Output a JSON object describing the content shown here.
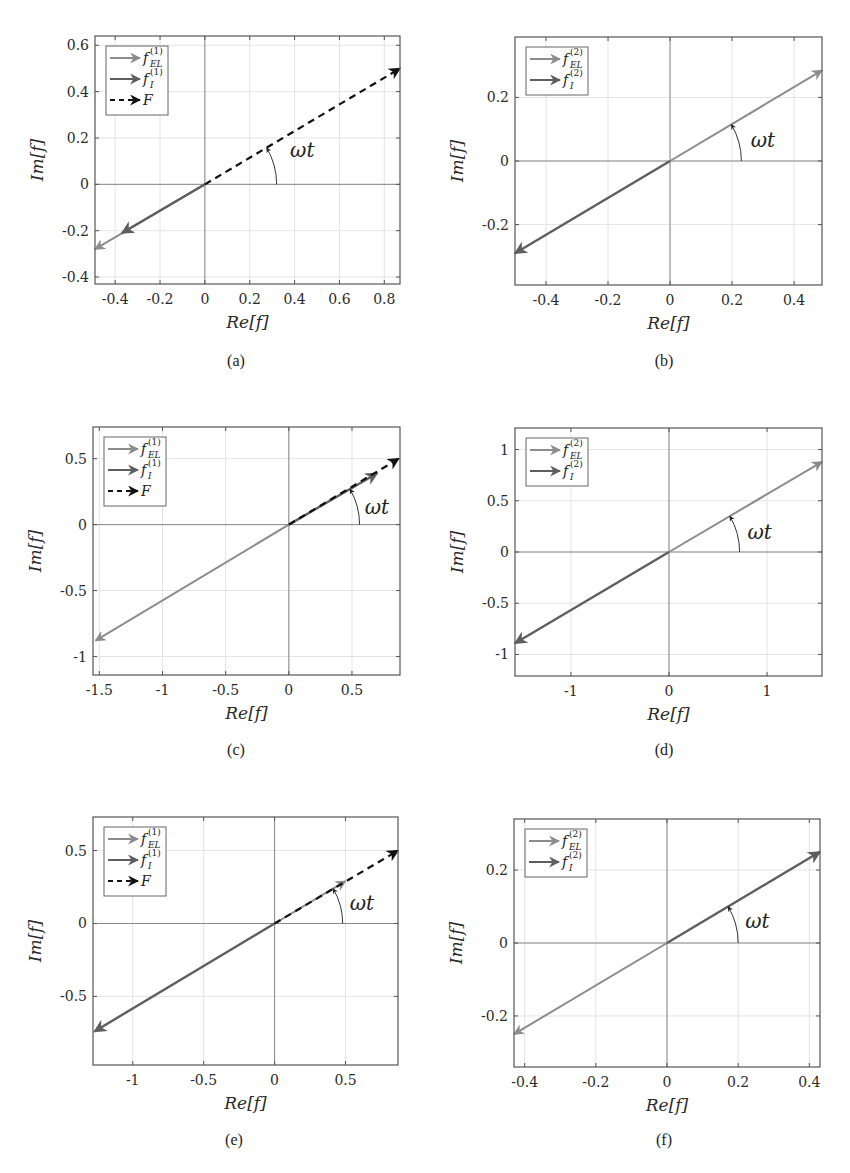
{
  "figure": {
    "panels": [
      {
        "id": "a",
        "caption": "(a)"
      },
      {
        "id": "b",
        "caption": "(b)"
      },
      {
        "id": "c",
        "caption": "(c)"
      },
      {
        "id": "d",
        "caption": "(d)"
      },
      {
        "id": "e",
        "caption": "(e)"
      },
      {
        "id": "f",
        "caption": "(f)"
      }
    ],
    "angle_label": "ωt",
    "colors": {
      "f_EL": "#8c8c8c",
      "f_I": "#5e5e5e",
      "F": "#111111",
      "axis": "#555555",
      "grid": "#e4e4e4",
      "zero": "#8a8a8a"
    }
  },
  "chart_data": [
    {
      "panel": "(a)",
      "type": "line",
      "title": "",
      "xlabel": "Re[f]",
      "ylabel": "Im[f]",
      "xlim": [
        -0.49,
        0.87
      ],
      "ylim": [
        -0.43,
        0.64
      ],
      "xticks": [
        -0.4,
        -0.2,
        0,
        0.2,
        0.4,
        0.6,
        0.8
      ],
      "xtick_labels": [
        "-0.4",
        "-0.2",
        "0",
        "0.2",
        "0.4",
        "0.6",
        "0.8"
      ],
      "yticks": [
        -0.4,
        -0.2,
        0,
        0.2,
        0.4,
        0.6
      ],
      "ytick_labels": [
        "-0.4",
        "-0.2",
        "0",
        "0.2",
        "0.4",
        "0.6"
      ],
      "grid": true,
      "legend_position": "upper left",
      "legend": [
        {
          "label": "f",
          "sub": "EL",
          "sup": "(1)",
          "style": "solid",
          "color": "#8c8c8c"
        },
        {
          "label": "f",
          "sub": "I",
          "sup": "(1)",
          "style": "solid",
          "color": "#5e5e5e"
        },
        {
          "label": "F",
          "sub": "",
          "sup": "",
          "style": "dashed",
          "color": "#111111"
        }
      ],
      "series": [
        {
          "name": "f_EL^(1)",
          "x": [
            0,
            -0.49
          ],
          "y": [
            0,
            -0.28
          ],
          "style": "solid",
          "color": "#8c8c8c",
          "width": 2
        },
        {
          "name": "f_I^(1)",
          "x": [
            0,
            -0.37
          ],
          "y": [
            0,
            -0.21
          ],
          "style": "solid",
          "color": "#5e5e5e",
          "width": 2.4
        },
        {
          "name": "F",
          "x": [
            0,
            0.87
          ],
          "y": [
            0,
            0.5
          ],
          "style": "dashed",
          "color": "#111111",
          "width": 2.2
        }
      ],
      "annotation": {
        "text": "ωt",
        "arc_radius_x": 0.32,
        "label_at": [
          0.38,
          0.15
        ]
      }
    },
    {
      "panel": "(b)",
      "type": "line",
      "title": "",
      "xlabel": "Re[f]",
      "ylabel": "Im[f]",
      "xlim": [
        -0.5,
        0.49
      ],
      "ylim": [
        -0.39,
        0.39
      ],
      "xticks": [
        -0.4,
        -0.2,
        0,
        0.2,
        0.4
      ],
      "xtick_labels": [
        "-0.4",
        "-0.2",
        "0",
        "0.2",
        "0.4"
      ],
      "yticks": [
        -0.2,
        0,
        0.2
      ],
      "ytick_labels": [
        "-0.2",
        "0",
        "0.2"
      ],
      "grid": true,
      "legend_position": "upper left",
      "legend": [
        {
          "label": "f",
          "sub": "EL",
          "sup": "(2)",
          "style": "solid",
          "color": "#8c8c8c"
        },
        {
          "label": "f",
          "sub": "I",
          "sup": "(2)",
          "style": "solid",
          "color": "#5e5e5e"
        }
      ],
      "series": [
        {
          "name": "f_EL^(2)",
          "x": [
            0,
            0.49
          ],
          "y": [
            0,
            0.285
          ],
          "style": "solid",
          "color": "#8c8c8c",
          "width": 2
        },
        {
          "name": "f_I^(2)",
          "x": [
            0,
            -0.5
          ],
          "y": [
            0,
            -0.29
          ],
          "style": "solid",
          "color": "#5e5e5e",
          "width": 2.4
        }
      ],
      "annotation": {
        "text": "ωt",
        "arc_radius_x": 0.23,
        "label_at": [
          0.26,
          0.065
        ]
      }
    },
    {
      "panel": "(c)",
      "type": "line",
      "title": "",
      "xlabel": "Re[f]",
      "ylabel": "Im[f]",
      "xlim": [
        -1.55,
        0.88
      ],
      "ylim": [
        -1.14,
        0.74
      ],
      "xticks": [
        -1.5,
        -1,
        -0.5,
        0,
        0.5
      ],
      "xtick_labels": [
        "-1.5",
        "-1",
        "-0.5",
        "0",
        "0.5"
      ],
      "yticks": [
        -1,
        -0.5,
        0,
        0.5
      ],
      "ytick_labels": [
        "-1",
        "-0.5",
        "0",
        "0.5"
      ],
      "grid": true,
      "legend_position": "upper left",
      "legend": [
        {
          "label": "f",
          "sub": "EL",
          "sup": "(1)",
          "style": "solid",
          "color": "#8c8c8c"
        },
        {
          "label": "f",
          "sub": "I",
          "sup": "(1)",
          "style": "solid",
          "color": "#5e5e5e"
        },
        {
          "label": "F",
          "sub": "",
          "sup": "",
          "style": "dashed",
          "color": "#111111"
        }
      ],
      "series": [
        {
          "name": "f_EL^(1)",
          "x": [
            0,
            -1.53
          ],
          "y": [
            0,
            -0.88
          ],
          "style": "solid",
          "color": "#8c8c8c",
          "width": 2
        },
        {
          "name": "f_I^(1)",
          "x": [
            0,
            0.7
          ],
          "y": [
            0,
            0.39
          ],
          "style": "solid",
          "color": "#5e5e5e",
          "width": 2.4
        },
        {
          "name": "F",
          "x": [
            0,
            0.87
          ],
          "y": [
            0,
            0.5
          ],
          "style": "dashed",
          "color": "#111111",
          "width": 2.2
        }
      ],
      "annotation": {
        "text": "ωt",
        "arc_radius_x": 0.56,
        "label_at": [
          0.6,
          0.13
        ]
      }
    },
    {
      "panel": "(d)",
      "type": "line",
      "title": "",
      "xlabel": "Re[f]",
      "ylabel": "Im[f]",
      "xlim": [
        -1.57,
        1.56
      ],
      "ylim": [
        -1.21,
        1.21
      ],
      "xticks": [
        -1,
        0,
        1
      ],
      "xtick_labels": [
        "-1",
        "0",
        "1"
      ],
      "yticks": [
        -1,
        -0.5,
        0,
        0.5,
        1
      ],
      "ytick_labels": [
        "-1",
        "-0.5",
        "0",
        "0.5",
        "1"
      ],
      "grid": true,
      "legend_position": "upper left",
      "legend": [
        {
          "label": "f",
          "sub": "EL",
          "sup": "(2)",
          "style": "solid",
          "color": "#8c8c8c"
        },
        {
          "label": "f",
          "sub": "I",
          "sup": "(2)",
          "style": "solid",
          "color": "#5e5e5e"
        }
      ],
      "series": [
        {
          "name": "f_EL^(2)",
          "x": [
            0,
            1.56
          ],
          "y": [
            0,
            0.88
          ],
          "style": "solid",
          "color": "#8c8c8c",
          "width": 2
        },
        {
          "name": "f_I^(2)",
          "x": [
            0,
            -1.57
          ],
          "y": [
            0,
            -0.89
          ],
          "style": "solid",
          "color": "#5e5e5e",
          "width": 2.4
        }
      ],
      "annotation": {
        "text": "ωt",
        "arc_radius_x": 0.72,
        "label_at": [
          0.8,
          0.2
        ]
      }
    },
    {
      "panel": "(e)",
      "type": "line",
      "title": "",
      "xlabel": "Re[f]",
      "ylabel": "Im[f]",
      "xlim": [
        -1.28,
        0.87
      ],
      "ylim": [
        -0.97,
        0.73
      ],
      "xticks": [
        -1,
        -0.5,
        0,
        0.5
      ],
      "xtick_labels": [
        "-1",
        "-0.5",
        "0",
        "0.5"
      ],
      "yticks": [
        -0.5,
        0,
        0.5
      ],
      "ytick_labels": [
        "-0.5",
        "0",
        "0.5"
      ],
      "grid": true,
      "legend_position": "upper left",
      "legend": [
        {
          "label": "f",
          "sub": "EL",
          "sup": "(1)",
          "style": "solid",
          "color": "#8c8c8c"
        },
        {
          "label": "f",
          "sub": "I",
          "sup": "(1)",
          "style": "solid",
          "color": "#5e5e5e"
        },
        {
          "label": "F",
          "sub": "",
          "sup": "",
          "style": "dashed",
          "color": "#111111"
        }
      ],
      "series": [
        {
          "name": "f_EL^(1)",
          "x": [
            0,
            0.5
          ],
          "y": [
            0,
            0.29
          ],
          "style": "solid",
          "color": "#8c8c8c",
          "width": 2
        },
        {
          "name": "f_I^(1)",
          "x": [
            0,
            -1.27
          ],
          "y": [
            0,
            -0.74
          ],
          "style": "solid",
          "color": "#5e5e5e",
          "width": 2.4
        },
        {
          "name": "F",
          "x": [
            0,
            0.87
          ],
          "y": [
            0,
            0.5
          ],
          "style": "dashed",
          "color": "#111111",
          "width": 2.2
        }
      ],
      "annotation": {
        "text": "ωt",
        "arc_radius_x": 0.48,
        "label_at": [
          0.53,
          0.14
        ]
      }
    },
    {
      "panel": "(f)",
      "type": "line",
      "title": "",
      "xlabel": "Re[f]",
      "ylabel": "Im[f]",
      "xlim": [
        -0.43,
        0.43
      ],
      "ylim": [
        -0.34,
        0.34
      ],
      "xticks": [
        -0.4,
        -0.2,
        0,
        0.2,
        0.4
      ],
      "xtick_labels": [
        "-0.4",
        "-0.2",
        "0",
        "0.2",
        "0.4"
      ],
      "yticks": [
        -0.2,
        0,
        0.2
      ],
      "ytick_labels": [
        "-0.2",
        "0",
        "0.2"
      ],
      "grid": true,
      "legend_position": "upper left",
      "legend": [
        {
          "label": "f",
          "sub": "EL",
          "sup": "(2)",
          "style": "solid",
          "color": "#8c8c8c"
        },
        {
          "label": "f",
          "sub": "I",
          "sup": "(2)",
          "style": "solid",
          "color": "#5e5e5e"
        }
      ],
      "series": [
        {
          "name": "f_EL^(2)",
          "x": [
            0,
            -0.43
          ],
          "y": [
            0,
            -0.25
          ],
          "style": "solid",
          "color": "#8c8c8c",
          "width": 2
        },
        {
          "name": "f_I^(2)",
          "x": [
            0,
            0.43
          ],
          "y": [
            0,
            0.25
          ],
          "style": "solid",
          "color": "#5e5e5e",
          "width": 2.4
        }
      ],
      "annotation": {
        "text": "ωt",
        "arc_radius_x": 0.2,
        "label_at": [
          0.22,
          0.06
        ]
      }
    }
  ]
}
